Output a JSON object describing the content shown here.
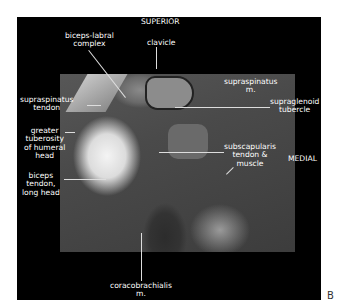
{
  "figure_label": "B",
  "orientation": {
    "top": "SUPERIOR",
    "right": "MEDIAL"
  },
  "labels": {
    "biceps_labral": [
      "biceps-labral",
      "complex"
    ],
    "clavicle": [
      "clavicle"
    ],
    "supraspinatus_m": [
      "supraspinatus",
      "m."
    ],
    "supraspinatus_tendon": [
      "supraspinatus",
      "tendon"
    ],
    "supraglenoid": [
      "supraglenoid",
      "tubercle"
    ],
    "greater_tuberosity": [
      "greater",
      "tuberosity",
      "of humeral",
      "head"
    ],
    "subscapularis": [
      "subscapularis",
      "tendon &",
      "muscle"
    ],
    "biceps_tendon": [
      "biceps",
      "tendon,",
      "long head"
    ],
    "coracobrachialis": [
      "coracobrachialis",
      "m."
    ]
  }
}
